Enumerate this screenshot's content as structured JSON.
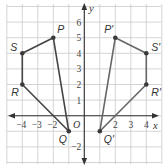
{
  "diagram": {
    "type": "coordinate-plane-reflection",
    "axes": {
      "x_label": "x",
      "y_label": "y",
      "origin_label": "O",
      "x_tick_labels": [
        {
          "value": -4,
          "text": "−4"
        },
        {
          "value": -3,
          "text": "−3"
        },
        {
          "value": -2,
          "text": "−2"
        },
        {
          "value": 2,
          "text": "2"
        },
        {
          "value": 3,
          "text": "3"
        },
        {
          "value": 4,
          "text": "4"
        }
      ],
      "y_tick_labels": [
        {
          "value": 1,
          "text": "1"
        },
        {
          "value": 2,
          "text": "2"
        },
        {
          "value": 3,
          "text": "3"
        },
        {
          "value": 4,
          "text": "4"
        },
        {
          "value": 5,
          "text": "5"
        },
        {
          "value": 6,
          "text": "6"
        },
        {
          "value": -2,
          "text": "−2"
        }
      ],
      "x_range": [
        -5,
        5
      ],
      "y_range": [
        -3,
        7
      ]
    },
    "polygons": [
      {
        "name": "PQRS",
        "color": "#444444",
        "vertices": [
          {
            "label": "P",
            "x": -2,
            "y": 5
          },
          {
            "label": "Q",
            "x": -1,
            "y": -1
          },
          {
            "label": "R",
            "x": -4,
            "y": 2
          },
          {
            "label": "S",
            "x": -4,
            "y": 4
          }
        ]
      },
      {
        "name": "P'Q'R'S'",
        "color": "#666666",
        "vertices": [
          {
            "label": "P′",
            "x": 2,
            "y": 5
          },
          {
            "label": "Q′",
            "x": 1,
            "y": -1
          },
          {
            "label": "R′",
            "x": 4,
            "y": 2
          },
          {
            "label": "S′",
            "x": 4,
            "y": 4
          }
        ]
      }
    ],
    "colors": {
      "grid": "#c9c9c9",
      "axis": "#333333",
      "point": "#3a3a3a"
    }
  }
}
